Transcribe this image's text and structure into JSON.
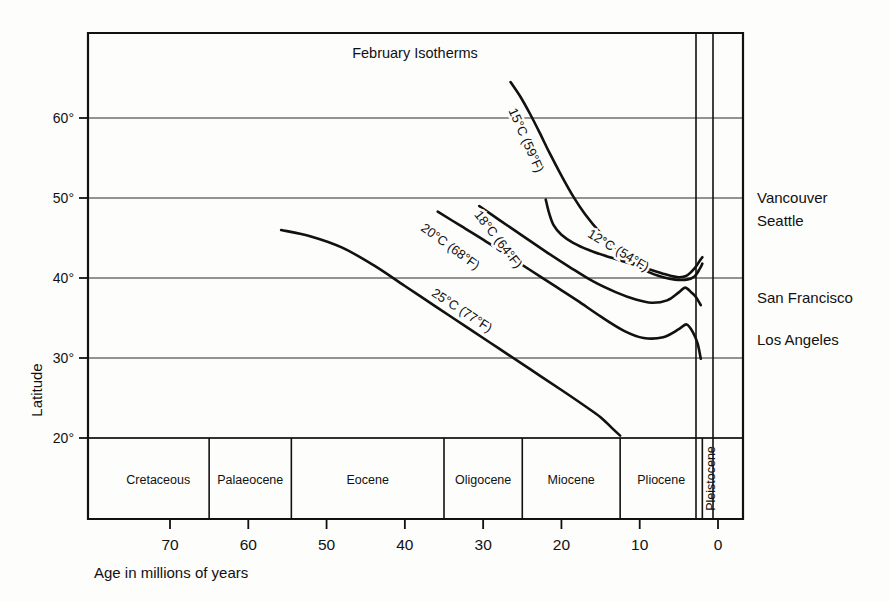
{
  "chart_data": {
    "type": "line",
    "title": "February Isotherms",
    "xlabel": "Age in  millions of years",
    "ylabel": "Latitude",
    "xlim": [
      78,
      -2
    ],
    "ylim": [
      18,
      68
    ],
    "x_ticks": [
      70,
      60,
      50,
      40,
      30,
      20,
      10,
      0
    ],
    "x_tick_labels": [
      "70",
      "60",
      "50",
      "40",
      "30",
      "20",
      "10",
      "0"
    ],
    "y_ticks": [
      20,
      30,
      40,
      50,
      60
    ],
    "y_tick_labels": [
      "20°",
      "30°",
      "40°",
      "50°",
      "60°"
    ],
    "grid": "horizontal",
    "legend_position": "right-annotations",
    "annotations": [
      {
        "text": "Vancouver",
        "latitude": 49.3
      },
      {
        "text": "Seattle",
        "latitude": 47.6
      },
      {
        "text": "San Francisco",
        "latitude": 37.8
      },
      {
        "text": "Los Angeles",
        "latitude": 34.1
      }
    ],
    "epochs": [
      {
        "name": "Cretaceous",
        "start": 78,
        "end": 65
      },
      {
        "name": "Palaeocene",
        "start": 65,
        "end": 54.5
      },
      {
        "name": "Eocene",
        "start": 54.5,
        "end": 35
      },
      {
        "name": "Oligocene",
        "start": 35,
        "end": 25
      },
      {
        "name": "Miocene",
        "start": 25,
        "end": 12.5
      },
      {
        "name": "Pliocene",
        "start": 12.5,
        "end": 2
      },
      {
        "name": "Pleistocene",
        "start": 2,
        "end": 0,
        "orientation": "vertical"
      }
    ],
    "series": [
      {
        "name": "25°C (77°F)",
        "label": "25°C (77°F)",
        "celsius": 25,
        "fahrenheit": 77,
        "label_x": 33,
        "label_y": 35.5,
        "points": [
          [
            55.8,
            46.0
          ],
          [
            52.0,
            45.2
          ],
          [
            48.0,
            43.8
          ],
          [
            44.0,
            41.6
          ],
          [
            40.0,
            39.0
          ],
          [
            36.0,
            36.4
          ],
          [
            32.0,
            33.8
          ],
          [
            28.0,
            31.2
          ],
          [
            24.0,
            28.6
          ],
          [
            20.0,
            26.0
          ],
          [
            17.0,
            24.0
          ],
          [
            15.0,
            22.6
          ],
          [
            13.5,
            21.2
          ],
          [
            12.5,
            20.3
          ]
        ]
      },
      {
        "name": "20°C (68°F)",
        "label": "20°C (68°F)",
        "celsius": 20,
        "fahrenheit": 68,
        "label_x": 34.5,
        "label_y": 43.5,
        "points": [
          [
            35.8,
            48.3
          ],
          [
            33.0,
            46.6
          ],
          [
            30.0,
            44.8
          ],
          [
            27.0,
            42.9
          ],
          [
            24.0,
            41.0
          ],
          [
            21.0,
            39.1
          ],
          [
            18.0,
            37.2
          ],
          [
            15.0,
            35.2
          ],
          [
            12.0,
            33.4
          ],
          [
            9.5,
            32.5
          ],
          [
            7.0,
            32.6
          ],
          [
            5.0,
            33.6
          ],
          [
            4.0,
            34.2
          ],
          [
            3.2,
            33.2
          ],
          [
            2.6,
            31.8
          ],
          [
            2.2,
            29.9
          ]
        ]
      },
      {
        "name": "18°C (64°F)",
        "label": "18°C (64°F)",
        "celsius": 18,
        "fahrenheit": 64,
        "label_x": 28.5,
        "label_y": 44.5,
        "points": [
          [
            30.5,
            49.0
          ],
          [
            28.0,
            47.3
          ],
          [
            25.0,
            45.3
          ],
          [
            22.0,
            43.3
          ],
          [
            19.0,
            41.4
          ],
          [
            16.0,
            39.6
          ],
          [
            13.0,
            38.2
          ],
          [
            10.5,
            37.3
          ],
          [
            8.5,
            36.9
          ],
          [
            6.5,
            37.2
          ],
          [
            5.0,
            38.2
          ],
          [
            4.2,
            38.8
          ],
          [
            3.4,
            38.2
          ],
          [
            2.8,
            37.6
          ],
          [
            2.2,
            36.6
          ]
        ]
      },
      {
        "name": "15°C (59°F)",
        "label": "15°C (59°F)",
        "celsius": 15,
        "fahrenheit": 59,
        "label_x": 25.0,
        "label_y": 57.0,
        "points": [
          [
            26.5,
            64.5
          ],
          [
            25.2,
            62.6
          ],
          [
            24.0,
            60.5
          ],
          [
            22.8,
            58.2
          ],
          [
            21.5,
            55.6
          ],
          [
            20.0,
            52.8
          ],
          [
            18.5,
            50.2
          ],
          [
            17.0,
            48.0
          ],
          [
            15.0,
            45.6
          ],
          [
            13.0,
            43.6
          ],
          [
            11.0,
            42.0
          ],
          [
            9.0,
            40.8
          ],
          [
            7.0,
            40.1
          ],
          [
            5.5,
            39.8
          ],
          [
            4.0,
            39.8
          ],
          [
            3.0,
            40.2
          ],
          [
            2.3,
            41.2
          ],
          [
            2.0,
            41.8
          ]
        ]
      },
      {
        "name": "12°C (54°F)",
        "label": "12°C (54°F)",
        "celsius": 12,
        "fahrenheit": 54,
        "label_x": 13.0,
        "label_y": 43.0,
        "points": [
          [
            22.0,
            49.8
          ],
          [
            21.6,
            48.2
          ],
          [
            21.0,
            46.6
          ],
          [
            20.0,
            45.4
          ],
          [
            18.5,
            44.4
          ],
          [
            16.5,
            43.5
          ],
          [
            14.5,
            42.8
          ],
          [
            12.5,
            42.2
          ],
          [
            10.5,
            41.6
          ],
          [
            8.5,
            41.0
          ],
          [
            6.5,
            40.4
          ],
          [
            5.0,
            40.1
          ],
          [
            4.0,
            40.3
          ],
          [
            3.0,
            41.2
          ],
          [
            2.3,
            42.2
          ],
          [
            2.0,
            42.6
          ]
        ]
      }
    ]
  },
  "axes": {
    "title": "February Isotherms",
    "y_axis_label": "Latitude",
    "x_axis_label": "Age in  millions of years",
    "y_tick_labels": [
      "60°",
      "50°",
      "40°",
      "30°",
      "20°"
    ],
    "x_tick_labels": [
      "70",
      "60",
      "50",
      "40",
      "30",
      "20",
      "10",
      "0"
    ]
  },
  "epoch_labels": {
    "cretaceous": "Cretaceous",
    "palaeocene": "Palaeocene",
    "eocene": "Eocene",
    "oligocene": "Oligocene",
    "miocene": "Miocene",
    "pliocene": "Pliocene",
    "pleistocene": "Pleistocene"
  },
  "city_labels": {
    "vancouver": "Vancouver",
    "seattle": "Seattle",
    "san_francisco": "San Francisco",
    "los_angeles": "Los Angeles"
  },
  "curve_labels": {
    "c25": "25°C (77°F)",
    "c20": "20°C (68°F)",
    "c18": "18°C (64°F)",
    "c15": "15°C (59°F)",
    "c12": "12°C (54°F)"
  },
  "colors": {
    "ink": "#111111",
    "paper": "#fdfdfc",
    "grid": "#2a2a2a"
  }
}
